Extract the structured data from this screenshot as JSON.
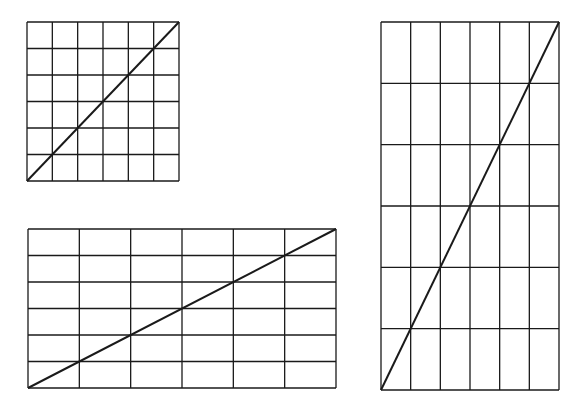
{
  "diagram": {
    "line_color": "#1a1a1a",
    "background": "#ffffff",
    "grids": [
      {
        "id": "square",
        "x": 27,
        "y": 22,
        "width": 152,
        "height": 159,
        "cols": 6,
        "rows": 6,
        "diagonal": "bottom-left-to-top-right"
      },
      {
        "id": "wide",
        "x": 28,
        "y": 229,
        "width": 308,
        "height": 159,
        "cols": 6,
        "rows": 6,
        "diagonal": "bottom-left-to-top-right"
      },
      {
        "id": "tall",
        "x": 381,
        "y": 22,
        "width": 178,
        "height": 368,
        "cols": 6,
        "rows": 6,
        "diagonal": "bottom-left-to-top-right"
      }
    ]
  }
}
